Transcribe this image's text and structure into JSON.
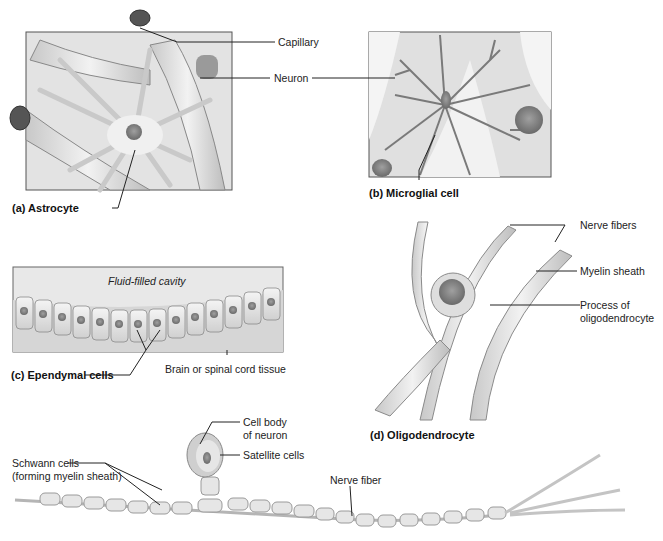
{
  "panels": {
    "a": {
      "caption": "(a)  Astrocyte",
      "labels": {
        "capillary": "Capillary",
        "neuron": "Neuron"
      }
    },
    "b": {
      "caption": "(b)  Microglial cell"
    },
    "c": {
      "caption": "(c)  Ependymal cells",
      "labels": {
        "cavity": "Fluid-filled cavity",
        "tissue": "Brain or spinal cord tissue"
      }
    },
    "d": {
      "caption": "(d)  Oligodendrocyte",
      "labels": {
        "nerve_fibers": "Nerve fibers",
        "myelin": "Myelin sheath",
        "process_1": "Process of",
        "process_2": "oligodendrocyte"
      }
    },
    "e": {
      "labels": {
        "cell_body_1": "Cell body",
        "cell_body_2": "of neuron",
        "satellite": "Satellite cells",
        "schwann_1": "Schwann cells",
        "schwann_2": "(forming myelin sheath)",
        "nerve_fiber": "Nerve fiber"
      }
    }
  },
  "colors": {
    "tissue": "#d9d9d9",
    "cell": "#eeeeee",
    "nucleus": "#8a8a8a",
    "outline": "#6e6e6e",
    "leader": "#222222"
  }
}
